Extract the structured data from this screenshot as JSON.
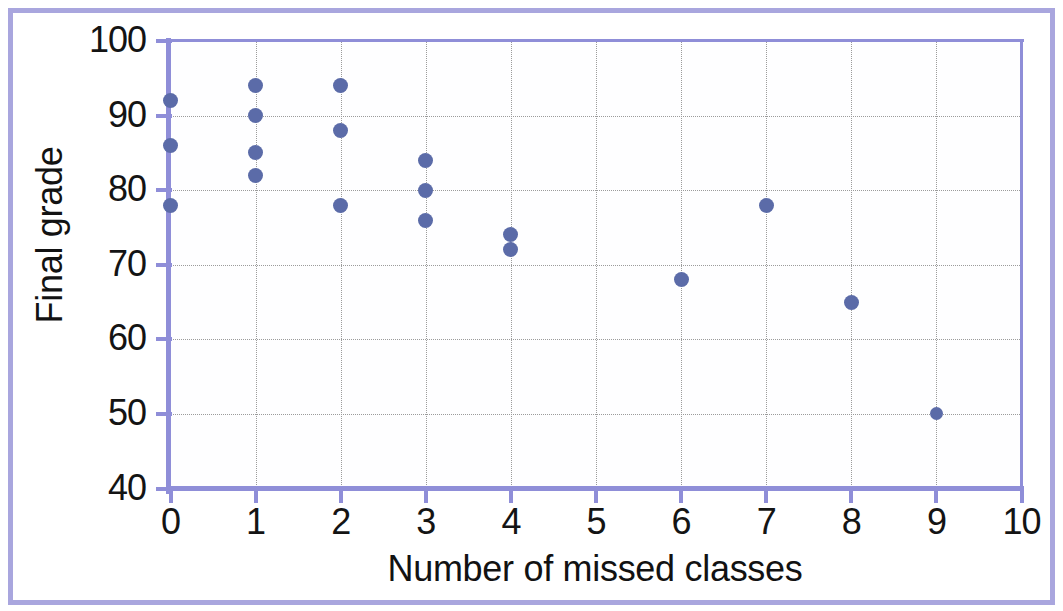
{
  "chart_data": {
    "type": "scatter",
    "title": "",
    "xlabel": "Number of missed classes",
    "ylabel": "Final grade",
    "xlim": [
      0,
      10
    ],
    "ylim": [
      40,
      100
    ],
    "xticks": [
      "0",
      "1",
      "2",
      "3",
      "4",
      "5",
      "6",
      "7",
      "8",
      "9",
      "10"
    ],
    "yticks": [
      "40",
      "50",
      "60",
      "70",
      "80",
      "90",
      "100"
    ],
    "grid": "both-dotted-grey",
    "legend": "none",
    "marker_color": "#5b6ba8",
    "axis_color": "#8f8ed8",
    "gridline_color": "#9b9b9b",
    "border_color": "#a9a6de",
    "background_color": "#ffffff",
    "series": [
      {
        "name": "students",
        "points": [
          {
            "x": 0,
            "y": 92
          },
          {
            "x": 0,
            "y": 86
          },
          {
            "x": 0,
            "y": 78
          },
          {
            "x": 1,
            "y": 94
          },
          {
            "x": 1,
            "y": 90
          },
          {
            "x": 1,
            "y": 85
          },
          {
            "x": 1,
            "y": 82
          },
          {
            "x": 2,
            "y": 94
          },
          {
            "x": 2,
            "y": 88
          },
          {
            "x": 2,
            "y": 78
          },
          {
            "x": 3,
            "y": 84
          },
          {
            "x": 3,
            "y": 80
          },
          {
            "x": 3,
            "y": 76
          },
          {
            "x": 4,
            "y": 74
          },
          {
            "x": 4,
            "y": 72
          },
          {
            "x": 6,
            "y": 68
          },
          {
            "x": 7,
            "y": 78
          },
          {
            "x": 8,
            "y": 65
          },
          {
            "x": 9,
            "y": 50
          }
        ]
      }
    ]
  }
}
